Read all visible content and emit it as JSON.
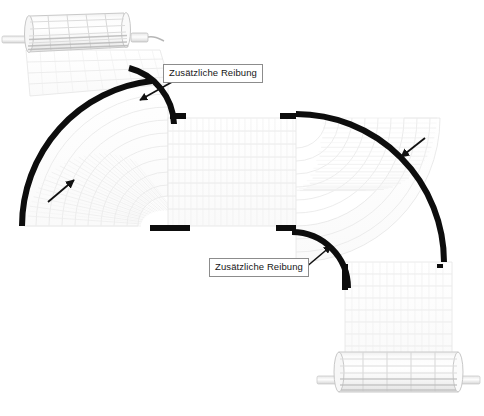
{
  "figure": {
    "kind": "technical-illustration",
    "background_color": "#ffffff",
    "belt_color": "#fbfbfb",
    "belt_outline_color": "#e2e2e2",
    "rail_color": "#0d0d0d",
    "roller_color": "#f2f2f2",
    "roller_outline_color": "#c9c9c9",
    "arrow_color": "#111111",
    "label_border_color": "#8c8c8c",
    "label_text_color": "#161616"
  },
  "annotations": {
    "top_label": "Zusätzliche Reibung",
    "bottom_label": "Zusätzliche Reibung"
  },
  "components": {
    "top_roller_name": "Antriebsrolle oben",
    "bottom_roller_name": "Antriebsrolle unten",
    "outer_rail_left_name": "Außenführung linke Kurve",
    "inner_rail_left_name": "Innenführung linke Kurve",
    "outer_rail_right_name": "Außenführung rechte Kurve",
    "inner_rail_right_name": "Innenführung rechte Kurve"
  }
}
